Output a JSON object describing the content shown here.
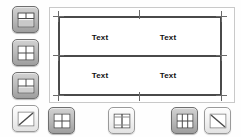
{
  "app": {
    "name": "table-layout-editor",
    "canvas_bg": "#ffffff",
    "accent": "#4a4a4a"
  },
  "left_toolbar": {
    "name": "left-toolbar",
    "buttons": [
      {
        "id": "table-grid-split-top",
        "icon": "table-grid-icon",
        "state": "dark",
        "label": "Insert table grid"
      },
      {
        "id": "table-grid-2x2",
        "icon": "table-grid-2x2-icon",
        "state": "dark",
        "label": "Table 2 by 2"
      },
      {
        "id": "table-grid-rows",
        "icon": "table-grid-rows-icon",
        "state": "dark",
        "label": "Table rows"
      },
      {
        "id": "diagonal-line",
        "icon": "diagonal-line-icon",
        "state": "light",
        "label": "Diagonal split"
      }
    ]
  },
  "bottom_toolbar": {
    "name": "bottom-toolbar",
    "buttons": [
      {
        "id": "grid-merge",
        "icon": "table-grid-2x2-icon",
        "state": "dark",
        "label": "Merge cells"
      },
      {
        "id": "split-vertical",
        "icon": "table-split-vertical-icon",
        "state": "light",
        "label": "Split vertically"
      },
      {
        "id": "grid-columns",
        "icon": "table-grid-columns-icon",
        "state": "dark",
        "label": "Split into columns"
      },
      {
        "id": "diagonal-clear",
        "icon": "diagonal-line-icon",
        "state": "light",
        "label": "Clear diagonal"
      }
    ]
  },
  "canvas": {
    "name": "table-canvas",
    "table": {
      "name": "selected-table",
      "rows": 2,
      "cols": 2,
      "selected": true,
      "cells": [
        [
          "Text",
          "Text"
        ],
        [
          "Text",
          "Text"
        ]
      ]
    },
    "handles": [
      {
        "id": "handle-top-left",
        "pos": "top-left"
      },
      {
        "id": "handle-top-center",
        "pos": "top-center"
      },
      {
        "id": "handle-top-right",
        "pos": "top-right"
      },
      {
        "id": "handle-middle-left",
        "pos": "middle-left"
      },
      {
        "id": "handle-middle-right",
        "pos": "middle-right"
      },
      {
        "id": "handle-bottom-left",
        "pos": "bottom-left"
      },
      {
        "id": "handle-bottom-center",
        "pos": "bottom-center"
      },
      {
        "id": "handle-bottom-right",
        "pos": "bottom-right"
      }
    ]
  }
}
